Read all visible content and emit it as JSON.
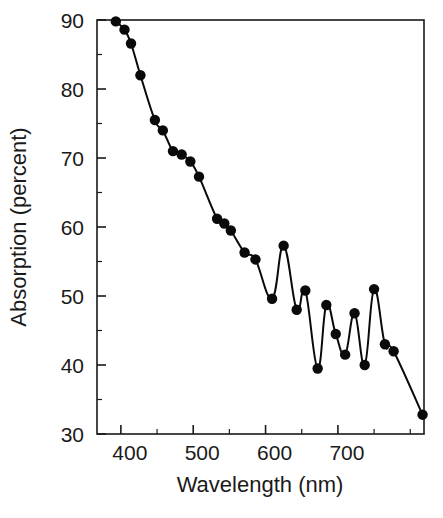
{
  "chart_data": {
    "type": "line",
    "title": "",
    "subtitle": "",
    "xlabel": "Wavelength (nm)",
    "ylabel": "Absorption (percent)",
    "xlim": [
      367,
      819
    ],
    "ylim": [
      30,
      90
    ],
    "xticks": [
      400,
      500,
      600,
      700
    ],
    "xticklabels": [
      "400",
      "500",
      "600",
      "700"
    ],
    "yticks": [
      30,
      40,
      50,
      60,
      70,
      80,
      90
    ],
    "yticklabels": [
      "30",
      "40",
      "50",
      "60",
      "70",
      "80",
      "90"
    ],
    "x_minor_tick_interval": 50,
    "y_minor_tick_interval": 5,
    "grid": false,
    "legend": false,
    "legend_position": "none",
    "marker": "filled-circle",
    "marker_color": "#0a0a0a",
    "line_color": "#0a0a0a",
    "background_color": "#ffffff",
    "series": [
      {
        "name": "Absorption",
        "x": [
          393,
          405,
          414,
          427,
          447,
          458,
          472,
          484,
          496,
          508,
          533,
          543,
          552,
          571,
          586,
          609,
          625,
          638,
          650,
          672,
          690,
          700,
          712,
          727,
          738,
          753,
          763,
          775,
          790,
          800,
          818
        ],
        "y": [
          89.8,
          88.6,
          86.6,
          82.0,
          75.5,
          74.0,
          71.0,
          70.5,
          69.5,
          67.3,
          61.2,
          60.5,
          59.5,
          56.3,
          55.3,
          49.6,
          57.3,
          48.0,
          50.8,
          39.5,
          48.7,
          44.5,
          41.5,
          47.5,
          40.0,
          51.0,
          43.0,
          42.0,
          32.8,
          32.8,
          32.8
        ]
      }
    ],
    "data_points": [
      {
        "wavelength": 393,
        "absorption": 89.8
      },
      {
        "wavelength": 405,
        "absorption": 88.6
      },
      {
        "wavelength": 414,
        "absorption": 86.6
      },
      {
        "wavelength": 427,
        "absorption": 82.0
      },
      {
        "wavelength": 447,
        "absorption": 75.5
      },
      {
        "wavelength": 458,
        "absorption": 74.0
      },
      {
        "wavelength": 472,
        "absorption": 71.0
      },
      {
        "wavelength": 484,
        "absorption": 70.5
      },
      {
        "wavelength": 496,
        "absorption": 69.5
      },
      {
        "wavelength": 508,
        "absorption": 67.3
      },
      {
        "wavelength": 533,
        "absorption": 61.2
      },
      {
        "wavelength": 543,
        "absorption": 60.5
      },
      {
        "wavelength": 552,
        "absorption": 59.5
      },
      {
        "wavelength": 571,
        "absorption": 56.3
      },
      {
        "wavelength": 586,
        "absorption": 55.3
      },
      {
        "wavelength": 609,
        "absorption": 49.6
      },
      {
        "wavelength": 625,
        "absorption": 57.3
      },
      {
        "wavelength": 643,
        "absorption": 48.0
      },
      {
        "wavelength": 655,
        "absorption": 50.8
      },
      {
        "wavelength": 672,
        "absorption": 39.5
      },
      {
        "wavelength": 684,
        "absorption": 48.7
      },
      {
        "wavelength": 697,
        "absorption": 44.5
      },
      {
        "wavelength": 710,
        "absorption": 41.5
      },
      {
        "wavelength": 723,
        "absorption": 47.5
      },
      {
        "wavelength": 737,
        "absorption": 40.0
      },
      {
        "wavelength": 750,
        "absorption": 51.0
      },
      {
        "wavelength": 765,
        "absorption": 43.0
      },
      {
        "wavelength": 777,
        "absorption": 42.0
      },
      {
        "wavelength": 817,
        "absorption": 32.8
      }
    ]
  }
}
